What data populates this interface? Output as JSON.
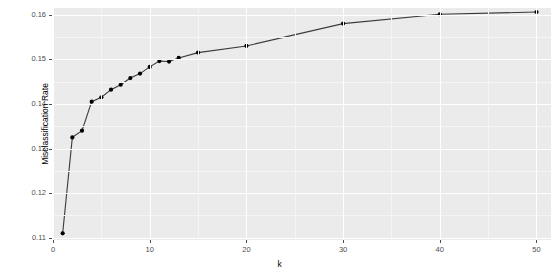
{
  "chart_data": {
    "type": "line",
    "title": "",
    "subtitle": "",
    "xlabel": "k",
    "ylabel": "Misclassification Rate",
    "xlim": [
      0,
      51.5
    ],
    "ylim": [
      0.1095,
      0.1615
    ],
    "grid": true,
    "legend": false,
    "marker": "filled-circle",
    "line_color": "#3a3a3a",
    "point_color": "#000000",
    "panel_color": "#ebebeb",
    "gridline_color": "#ffffff",
    "x_ticks": [
      0,
      10,
      20,
      30,
      40,
      50
    ],
    "x_tick_labels": [
      "0",
      "10",
      "20",
      "30",
      "40",
      "50"
    ],
    "y_ticks": [
      0.11,
      0.12,
      0.13,
      0.14,
      0.15,
      0.16
    ],
    "y_tick_labels": [
      "0.11",
      "0.12",
      "0.13",
      "0.14",
      "0.15",
      "0.16"
    ],
    "x": [
      1,
      2,
      3,
      4,
      5,
      6,
      7,
      8,
      9,
      10,
      11,
      12,
      13,
      15,
      20,
      30,
      40,
      50
    ],
    "y": [
      0.111,
      0.1325,
      0.134,
      0.1405,
      0.1415,
      0.1432,
      0.1443,
      0.1458,
      0.1468,
      0.1483,
      0.1496,
      0.1495,
      0.1503,
      0.1515,
      0.153,
      0.158,
      0.1601,
      0.1606
    ],
    "series": [
      {
        "name": "Misclassification Rate",
        "values": [
          0.111,
          0.1325,
          0.134,
          0.1405,
          0.1415,
          0.1432,
          0.1443,
          0.1458,
          0.1468,
          0.1483,
          0.1496,
          0.1495,
          0.1503,
          0.1515,
          0.153,
          0.158,
          0.1601,
          0.1606
        ]
      }
    ]
  },
  "axes": {
    "y_labels": [
      "0.16",
      "0.15",
      "0.14",
      "0.13",
      "0.12",
      "0.11"
    ],
    "x_labels": [
      "0",
      "10",
      "20",
      "30",
      "40",
      "50"
    ],
    "y_title": "Misclassification Rate",
    "x_title": "k"
  }
}
